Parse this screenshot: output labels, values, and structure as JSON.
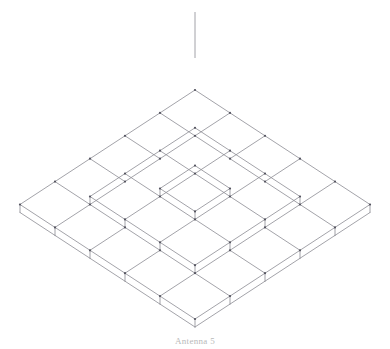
{
  "figure": {
    "caption": "Antenna 5",
    "background_color": "#ffffff",
    "line_color": "#8c8c93",
    "vertex_color": "#555560",
    "line_width": 0.8,
    "geometry": {
      "description": "Isometric wireframe of a stepped square pyramid built from unit cubes, with a vertical antenna mast rising from the apex.",
      "projection": "isometric",
      "levels": 5,
      "base_footprint": "5 x 5 cubes",
      "cube_counts_per_level": [
        25,
        16,
        9,
        4,
        1
      ],
      "total_cubes": 55,
      "apex_pixel": [
        195,
        58
      ],
      "bottom_vertex_pixel": [
        195,
        327
      ],
      "left_vertex_pixel": [
        20,
        306
      ],
      "right_vertex_pixel": [
        370,
        306
      ],
      "origin_pixel": [
        195,
        98
      ],
      "half_width_px": 35,
      "half_depth_px": 20,
      "cube_height_px": 40,
      "antenna": {
        "name": "antenna-mast",
        "from_pixel": [
          195,
          58
        ],
        "to_pixel": [
          195,
          12
        ],
        "length_px": 46
      }
    }
  },
  "chart_data": {
    "type": "diagram",
    "xlabel": "",
    "ylabel": "",
    "legend": [],
    "levels": [
      {
        "level": 1,
        "grid": 5,
        "cubes": 25
      },
      {
        "level": 2,
        "grid": 4,
        "cubes": 16
      },
      {
        "level": 3,
        "grid": 3,
        "cubes": 9
      },
      {
        "level": 4,
        "grid": 2,
        "cubes": 4
      },
      {
        "level": 5,
        "grid": 1,
        "cubes": 1
      }
    ]
  }
}
